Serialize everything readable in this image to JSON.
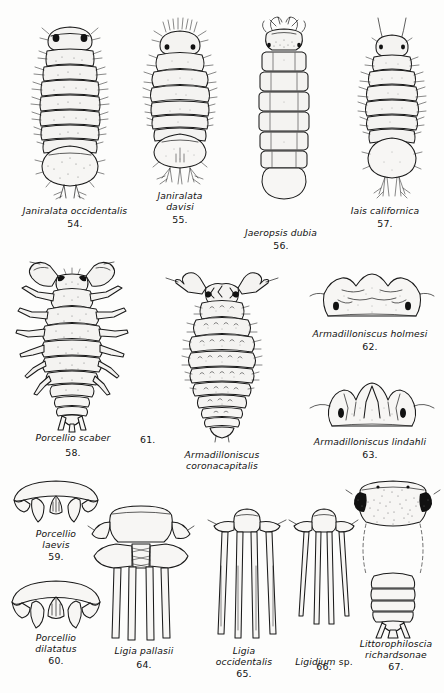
{
  "plate": {
    "description": "Scientific line-drawing plate of isopod crustaceans, figures 54 through 67",
    "background_color": "#fdfdfc",
    "ink_color": "#1a1a1a"
  },
  "figures": [
    {
      "id": "fig-54",
      "number": "54.",
      "name": "Janiralata occidentalis",
      "icon": "isopod-dorsal-icon",
      "caption_lines": [
        "Janiralata occidentalis"
      ]
    },
    {
      "id": "fig-55",
      "number": "55.",
      "name": "Janiralata davisi",
      "icon": "isopod-dorsal-icon",
      "caption_lines": [
        "Janiralata",
        "davisi"
      ]
    },
    {
      "id": "fig-56",
      "number": "56.",
      "name": "Jaeropsis dubia",
      "icon": "isopod-dorsal-icon",
      "caption_lines": [
        "Jaeropsis dubia"
      ]
    },
    {
      "id": "fig-57",
      "number": "57.",
      "name": "Iais californica",
      "icon": "isopod-dorsal-icon",
      "caption_lines": [
        "Iais californica"
      ]
    },
    {
      "id": "fig-58",
      "number": "58.",
      "name": "Porcellio scaber",
      "icon": "isopod-dorsal-icon",
      "caption_lines": [
        "Porcellio scaber"
      ]
    },
    {
      "id": "fig-61",
      "number": "61.",
      "name": "Armadilloniscus coronacapitalis",
      "icon": "isopod-dorsal-icon",
      "caption_lines": [
        "Armadilloniscus",
        "coronacapitalis"
      ]
    },
    {
      "id": "fig-62",
      "number": "62.",
      "name": "Armadilloniscus holmesi",
      "icon": "isopod-head-icon",
      "caption_lines": [
        "Armadilloniscus holmesi"
      ]
    },
    {
      "id": "fig-63",
      "number": "63.",
      "name": "Armadilloniscus lindahli",
      "icon": "isopod-head-icon",
      "caption_lines": [
        "Armadilloniscus lindahli"
      ]
    },
    {
      "id": "fig-59",
      "number": "59.",
      "name": "Porcellio laevis",
      "icon": "isopod-telson-icon",
      "caption_lines": [
        "Porcellio",
        "laevis"
      ]
    },
    {
      "id": "fig-60",
      "number": "60.",
      "name": "Porcellio dilatatus",
      "icon": "isopod-telson-icon",
      "caption_lines": [
        "Porcellio",
        "dilatatus"
      ]
    },
    {
      "id": "fig-64",
      "number": "64.",
      "name": "Ligia pallasii",
      "icon": "isopod-uropod-icon",
      "caption_lines": [
        "Ligia pallasii"
      ]
    },
    {
      "id": "fig-65",
      "number": "65.",
      "name": "Ligia occidentalis",
      "icon": "isopod-uropod-icon",
      "caption_lines": [
        "Ligia",
        "occidentalis"
      ]
    },
    {
      "id": "fig-66",
      "number": "66.",
      "name": "Ligidium sp.",
      "icon": "isopod-uropod-icon",
      "caption_genus": "Ligidium",
      "caption_suffix": "sp.",
      "caption_lines": [
        "Ligidium sp."
      ]
    },
    {
      "id": "fig-67",
      "number": "67.",
      "name": "Littorophiloscia richardsonae",
      "icon": "isopod-head-abdomen-icon",
      "caption_lines": [
        "Littorophiloscia",
        "richardsonae"
      ]
    }
  ],
  "captions": {
    "c54": "Janiralata occidentalis",
    "n54": "54.",
    "c55": "Janiralata\ndavisi",
    "n55": "55.",
    "c56": "Jaeropsis dubia",
    "n56": "56.",
    "c57": "Iais californica",
    "n57": "57.",
    "c58": "Porcellio scaber",
    "n58": "58.",
    "c61": "Armadilloniscus\ncoronacapitalis",
    "n61": "61.",
    "c62": "Armadilloniscus holmesi",
    "n62": "62.",
    "c63": "Armadilloniscus lindahli",
    "n63": "63.",
    "c59": "Porcellio\nlaevis",
    "n59": "59.",
    "c60": "Porcellio\ndilatatus",
    "n60": "60.",
    "c64": "Ligia pallasii",
    "n64": "64.",
    "c65": "Ligia\noccidentalis",
    "n65": "65.",
    "c66g": "Ligidium",
    "c66s": "sp.",
    "n66": "66.",
    "c67": "Littorophiloscia\nrichardsonae",
    "n67": "67."
  }
}
